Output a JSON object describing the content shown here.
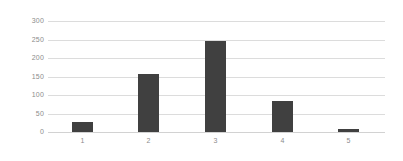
{
  "chart_data": {
    "type": "bar",
    "title": "",
    "subtitle": "",
    "xlabel": "",
    "ylabel": "",
    "categories": [
      "1",
      "2",
      "3",
      "4",
      "5"
    ],
    "values": [
      28,
      157,
      247,
      84,
      7
    ],
    "series": [
      {
        "name": "",
        "values": [
          28,
          157,
          247,
          84,
          7
        ]
      }
    ],
    "ylim": [
      0,
      300
    ],
    "yticks": [
      0,
      50,
      100,
      150,
      200,
      250,
      300
    ],
    "ytick_labels": [
      "0",
      "50",
      "100",
      "150",
      "200",
      "250",
      "300"
    ],
    "xtick_labels": [
      "1",
      "2",
      "3",
      "4",
      "5"
    ],
    "grid": true,
    "grid_axis": "y",
    "legend": false,
    "legend_position": "none",
    "annotations": [],
    "colors": {
      "bar": "#404040",
      "gridline": "#dcdcdc",
      "baseline": "#d2d2d2",
      "tick_label": "#8c8c8c",
      "background": "#ffffff"
    }
  }
}
